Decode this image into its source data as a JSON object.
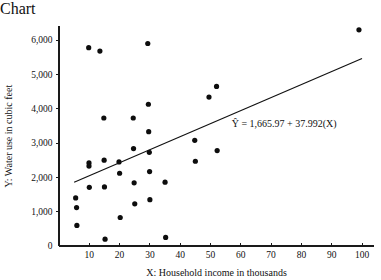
{
  "chart_data": {
    "type": "scatter",
    "title": "",
    "xlabel": "X:  Household income in thousands",
    "ylabel": "Y:  Water use in cubic feet",
    "xlim": [
      0,
      104
    ],
    "ylim": [
      0,
      6400
    ],
    "grid": false,
    "legend": "none",
    "xticks": [
      10,
      20,
      30,
      40,
      50,
      60,
      70,
      80,
      90,
      100
    ],
    "xtick_labels": [
      "10",
      "20",
      "30",
      "40",
      "50",
      "60",
      "70",
      "80",
      "90",
      "100"
    ],
    "yticks": [
      0,
      1000,
      2000,
      3000,
      4000,
      5000,
      6000
    ],
    "ytick_labels": [
      "0",
      "1,000",
      "2,000",
      "3,000",
      "4,000",
      "5,000",
      "6,000"
    ],
    "annotations": [
      {
        "name": "regression-equation",
        "text": "Ŷ = 1,665.97 + 37.992(X)",
        "x": 57,
        "y": 3460
      }
    ],
    "series": [
      {
        "name": "Household water use",
        "marker": "filled-circle",
        "color": "#0d0d0d",
        "points": [
          [
            5.5,
            1400
          ],
          [
            5.8,
            1120
          ],
          [
            5.9,
            600
          ],
          [
            9.8,
            5780
          ],
          [
            9.9,
            2420
          ],
          [
            9.9,
            2330
          ],
          [
            10.0,
            1710
          ],
          [
            13.5,
            5680
          ],
          [
            14.8,
            3730
          ],
          [
            14.9,
            2500
          ],
          [
            15.0,
            1720
          ],
          [
            15.2,
            200
          ],
          [
            19.8,
            2450
          ],
          [
            20.0,
            2120
          ],
          [
            20.2,
            830
          ],
          [
            24.5,
            3730
          ],
          [
            24.6,
            2840
          ],
          [
            24.8,
            1840
          ],
          [
            25.0,
            1230
          ],
          [
            29.3,
            5900
          ],
          [
            29.5,
            4130
          ],
          [
            29.6,
            3330
          ],
          [
            29.8,
            2730
          ],
          [
            29.9,
            2170
          ],
          [
            30.0,
            1350
          ],
          [
            35.0,
            1860
          ],
          [
            35.2,
            250
          ],
          [
            44.8,
            3080
          ],
          [
            45.0,
            2470
          ],
          [
            49.5,
            4340
          ],
          [
            52.0,
            4650
          ],
          [
            52.2,
            2780
          ],
          [
            99.0,
            6300
          ]
        ]
      }
    ],
    "regression": {
      "equation": "Ŷ = 1,665.97 + 37.992(X)",
      "intercept": 1665.97,
      "slope": 37.992,
      "x_start": 5,
      "x_end": 100
    }
  }
}
